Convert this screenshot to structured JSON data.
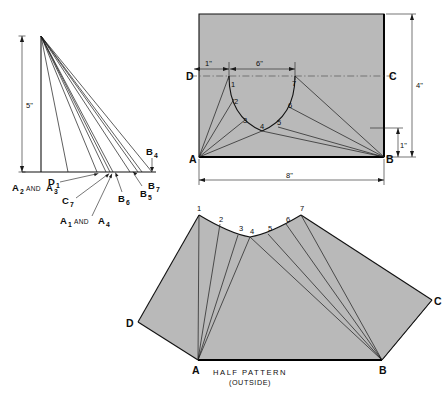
{
  "figure": {
    "background_color": "#ffffff",
    "fill_color": "#b9b9b9",
    "line_color": "#111111"
  },
  "left_view": {
    "name": "true-length-diagram",
    "vertical_dimension": "5\"",
    "baseline_labels": [
      {
        "key": "d1",
        "text": "D",
        "sub": "1"
      },
      {
        "key": "b4",
        "text": "B",
        "sub": "4"
      },
      {
        "key": "b7",
        "text": "B",
        "sub": "7"
      },
      {
        "key": "b5",
        "text": "B",
        "sub": "5"
      },
      {
        "key": "b6",
        "text": "B",
        "sub": "6"
      }
    ],
    "group_labels": [
      {
        "key": "a2a3",
        "first": "A",
        "first_sub": "2",
        "conj": "AND",
        "second": "A",
        "second_sub": "3"
      },
      {
        "key": "c7",
        "first": "C",
        "first_sub": "7"
      },
      {
        "key": "a1a4",
        "first": "A",
        "first_sub": "1",
        "conj": "AND",
        "second": "A",
        "second_sub": "4"
      }
    ]
  },
  "top_view": {
    "name": "plan-view",
    "corner_labels": [
      {
        "key": "a",
        "text": "A"
      },
      {
        "key": "b",
        "text": "B"
      },
      {
        "key": "c",
        "text": "C"
      },
      {
        "key": "d",
        "text": "D"
      }
    ],
    "curve_points": [
      "1",
      "2",
      "3",
      "4",
      "5",
      "6",
      "7"
    ],
    "dimensions": [
      {
        "key": "width",
        "text": "8\""
      },
      {
        "key": "height",
        "text": "6\""
      },
      {
        "key": "offset-left",
        "text": "1\""
      },
      {
        "key": "span-top",
        "text": "4\""
      },
      {
        "key": "offset-bottom",
        "text": "1\""
      }
    ]
  },
  "bottom_view": {
    "name": "half-pattern",
    "caption_line1": "HALF PATTERN",
    "caption_line2": "(OUTSIDE)",
    "corner_labels": [
      {
        "key": "a",
        "text": "A"
      },
      {
        "key": "b",
        "text": "B"
      },
      {
        "key": "c",
        "text": "C"
      },
      {
        "key": "d",
        "text": "D"
      }
    ],
    "curve_points": [
      "1",
      "2",
      "3",
      "4",
      "5",
      "6",
      "7"
    ]
  }
}
